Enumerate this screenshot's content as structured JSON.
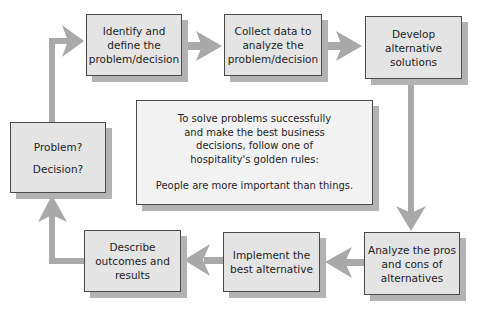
{
  "diagram": {
    "type": "cycle flowchart",
    "colors": {
      "box_fill": "#e4e4e4",
      "center_fill": "#f2f2f2",
      "border": "#4a4a4a",
      "shadow": "#b3b3b3",
      "arrow": "#a9a9a9"
    },
    "steps": [
      {
        "id": "problem",
        "lines": [
          "Problem?",
          "Decision?"
        ]
      },
      {
        "id": "identify",
        "lines": [
          "Identify and",
          "define the",
          "problem/decision"
        ]
      },
      {
        "id": "collect",
        "lines": [
          "Collect data to",
          "analyze the",
          "problem/decision"
        ]
      },
      {
        "id": "develop",
        "lines": [
          "Develop",
          "alternative",
          "solutions"
        ]
      },
      {
        "id": "analyze",
        "lines": [
          "Analyze the pros",
          "and cons of",
          "alternatives"
        ]
      },
      {
        "id": "implement",
        "lines": [
          "Implement the",
          "best alternative"
        ]
      },
      {
        "id": "describe",
        "lines": [
          "Describe",
          "outcomes and",
          "results"
        ]
      }
    ],
    "flow": [
      "problem",
      "identify",
      "collect",
      "develop",
      "analyze",
      "implement",
      "describe",
      "problem"
    ],
    "center_note": {
      "lines": [
        "To solve problems successfully",
        "and make the best business",
        "decisions, follow one of",
        "hospitality's golden rules:"
      ],
      "rule": "People are more important than things."
    }
  }
}
